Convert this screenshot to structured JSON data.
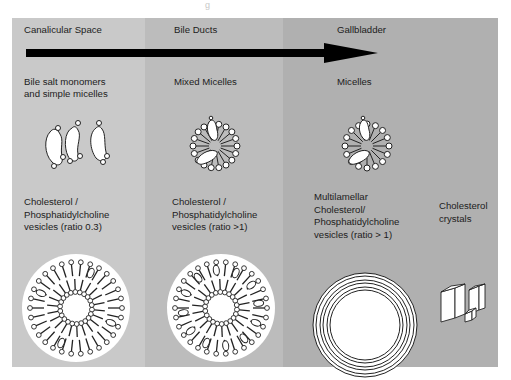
{
  "figure": {
    "title_fragment": "g",
    "flow_arrow": "direction-of-bile-flow",
    "stages": [
      {
        "name": "Canalicular Space"
      },
      {
        "name": "Bile Ducts"
      },
      {
        "name": "Gallbladder"
      }
    ],
    "micelle_row": [
      {
        "label_line1": "Bile salt monomers",
        "label_line2": "and simple micelles",
        "icon": "bile-salt-monomers-icon"
      },
      {
        "label_line1": "Mixed Micelles",
        "icon": "mixed-micelle-icon"
      },
      {
        "label_line1": "Micelles",
        "icon": "micelle-icon"
      }
    ],
    "vesicle_row": [
      {
        "label_lines": [
          "Cholesterol /",
          "Phosphatidylcholine",
          "vesicles (ratio 0.3)"
        ],
        "icon": "unilamellar-vesicle-icon"
      },
      {
        "label_lines": [
          "Cholesterol /",
          "Phosphatidylcholine",
          "vesicles (ratio >1)"
        ],
        "icon": "cholesterol-rich-vesicle-icon"
      },
      {
        "label_lines": [
          "Multilamellar",
          "Cholesterol/",
          "Phosphatidylcholine",
          "vesicles (ratio > 1)"
        ],
        "icon": "multilamellar-vesicle-icon"
      },
      {
        "label_lines": [
          "Cholesterol",
          "crystals"
        ],
        "icon": "cholesterol-crystals-icon"
      }
    ],
    "colors": {
      "canalicular_bg": "#c9c9c9",
      "bile_ducts_bg": "#bcbcbc",
      "gallbladder_bg": "#b0b0b0",
      "arrow": "#000000",
      "molecule_fill": "#ffffff",
      "outline": "#222222"
    }
  }
}
